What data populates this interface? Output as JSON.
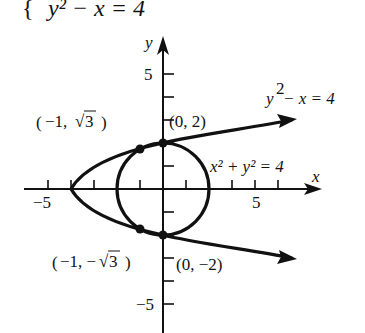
{
  "header": {
    "equation_fragment": "y² − x = 4",
    "brace": "{"
  },
  "axes": {
    "x_label": "x",
    "y_label": "y",
    "x_tick_labels": {
      "neg": "−5",
      "pos": "5"
    },
    "y_tick_labels": {
      "pos": "5",
      "neg": "−5"
    },
    "range": [
      -6,
      6
    ]
  },
  "curves": [
    {
      "name": "parabola",
      "equation": "y² − x = 4",
      "label_base": "y",
      "label_exp": "2",
      "label_rest": " − x = 4"
    },
    {
      "name": "circle",
      "equation": "x² + y² = 4",
      "label": "x² + y² = 4"
    }
  ],
  "points": [
    {
      "name": "top-left",
      "label_open": "(−1, ",
      "label_root": "3",
      "label_close": ")",
      "x": -1,
      "y": 1.732
    },
    {
      "name": "top",
      "label": "(0, 2)",
      "x": 0,
      "y": 2
    },
    {
      "name": "bottom-left",
      "label_open": "(−1, −",
      "label_root": "3",
      "label_close": ")",
      "x": -1,
      "y": -1.732
    },
    {
      "name": "bottom",
      "label": "(0, −2)",
      "x": 0,
      "y": -2
    }
  ],
  "colors": {
    "ink": "#111111",
    "background": "#ffffff"
  }
}
